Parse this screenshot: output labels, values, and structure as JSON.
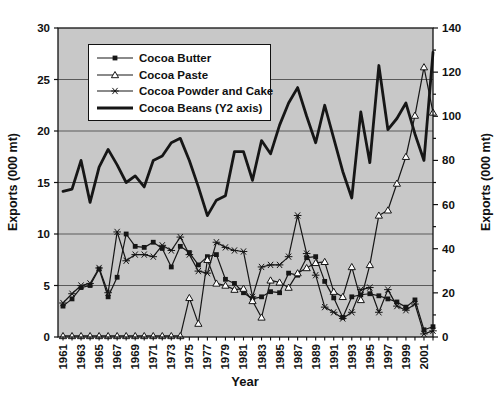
{
  "figure": {
    "width": 501,
    "height": 402
  },
  "chart_data": {
    "type": "line",
    "title": "",
    "xlabel": "Year",
    "ylabel_left": "Exports (000 mt)",
    "ylabel_right": "Exports (000 mt)",
    "x": [
      1961,
      1962,
      1963,
      1964,
      1965,
      1966,
      1967,
      1968,
      1969,
      1970,
      1971,
      1972,
      1973,
      1974,
      1975,
      1976,
      1977,
      1978,
      1979,
      1980,
      1981,
      1982,
      1983,
      1984,
      1985,
      1986,
      1987,
      1988,
      1989,
      1990,
      1991,
      1992,
      1993,
      1994,
      1995,
      1996,
      1997,
      1998,
      1999,
      2000,
      2001,
      2002
    ],
    "x_tick_labels": [
      "1961",
      "1963",
      "1965",
      "1967",
      "1969",
      "1971",
      "1973",
      "1975",
      "1977",
      "1979",
      "1981",
      "1983",
      "1985",
      "1987",
      "1989",
      "1991",
      "1993",
      "1995",
      "1997",
      "1999",
      "2001"
    ],
    "y_left": {
      "min": 0,
      "max": 30,
      "step": 5,
      "tick_labels": [
        "0",
        "5",
        "10",
        "15",
        "20",
        "25",
        "30"
      ]
    },
    "y_right": {
      "min": 0,
      "max": 140,
      "step": 20,
      "minor_step": 10,
      "tick_labels": [
        "0",
        "20",
        "40",
        "60",
        "80",
        "100",
        "120",
        "140"
      ]
    },
    "grid": "horizontal",
    "legend_position": "top-left-inside",
    "series": [
      {
        "name": "Cocoa Butter",
        "axis": "left",
        "marker": "square",
        "values": [
          3.0,
          3.7,
          4.8,
          5.0,
          6.6,
          3.9,
          5.8,
          10.0,
          8.8,
          8.7,
          9.2,
          8.6,
          6.8,
          8.8,
          8.2,
          7.0,
          7.8,
          8.0,
          5.6,
          5.2,
          4.3,
          3.7,
          3.9,
          4.4,
          4.3,
          6.2,
          6.0,
          7.7,
          7.8,
          5.4,
          3.8,
          1.9,
          3.9,
          4.1,
          4.2,
          4.0,
          3.7,
          3.4,
          2.9,
          3.6,
          0.7,
          1.0
        ]
      },
      {
        "name": "Cocoa Paste",
        "axis": "left",
        "marker": "triangle",
        "values": [
          0.1,
          0.1,
          0.1,
          0.1,
          0.1,
          0.1,
          0.1,
          0.1,
          0.1,
          0.1,
          0.1,
          0.1,
          0.1,
          0.1,
          3.8,
          1.3,
          7.5,
          5.2,
          5.0,
          4.6,
          4.7,
          3.5,
          1.9,
          5.5,
          5.3,
          4.8,
          6.2,
          6.7,
          7.2,
          7.3,
          4.4,
          3.9,
          6.8,
          3.6,
          7.0,
          11.8,
          12.3,
          14.9,
          17.5,
          21.5,
          26.2,
          21.8
        ]
      },
      {
        "name": "Cocoa Powder and Cake",
        "axis": "left",
        "marker": "star",
        "values": [
          3.3,
          4.2,
          5.0,
          5.2,
          6.7,
          4.3,
          10.2,
          7.4,
          8.0,
          8.0,
          7.8,
          8.9,
          8.4,
          9.7,
          8.0,
          6.4,
          6.2,
          9.2,
          8.7,
          8.4,
          8.3,
          3.9,
          6.8,
          7.0,
          7.0,
          7.8,
          11.8,
          8.1,
          6.0,
          2.9,
          2.4,
          1.8,
          2.4,
          4.6,
          4.8,
          2.4,
          4.6,
          3.0,
          2.6,
          3.2,
          0.3,
          0.6
        ]
      },
      {
        "name": "Cocoa Beans (Y2 axis)",
        "axis": "right",
        "marker": "none",
        "values": [
          66,
          67,
          80,
          61,
          77,
          85,
          78,
          70,
          73,
          68,
          80,
          82,
          88,
          90,
          80,
          68,
          55,
          62,
          64,
          84,
          84,
          71,
          89,
          83,
          96,
          106,
          113,
          100,
          88,
          105,
          90,
          75,
          63,
          102,
          79,
          123,
          94,
          99,
          106,
          92,
          80,
          129
        ]
      }
    ],
    "colors": {
      "line": "#161616",
      "plot_bg": "#c8c8c8",
      "grid": "#5a5a5a",
      "frame": "#111111",
      "marker_fill_open": "#ffffff",
      "text": "#111111"
    }
  }
}
